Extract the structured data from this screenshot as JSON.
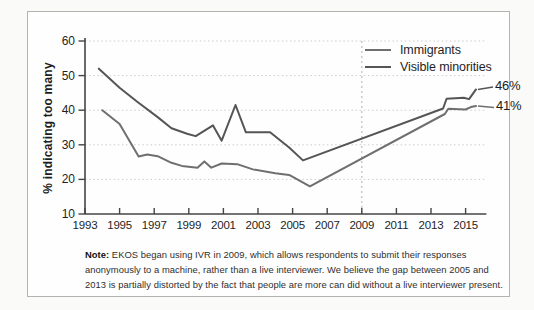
{
  "figure": {
    "y_axis_title": "% indicating too many",
    "note_label": "Note:",
    "note_text": " EKOS began using IVR in 2009, which allows respondents to submit their responses anonymously to a machine, rather than a live interviewer. We believe the gap between 2005 and 2013 is partially distorted by the fact that people are more can did without a live interviewer present."
  },
  "chart_data": {
    "type": "line",
    "title": "",
    "xlabel": "",
    "ylabel": "% indicating too many",
    "legend_position": "top-right",
    "grid": "horizontal-dashed",
    "divider_year": 2009,
    "x_axis": {
      "min": 1993,
      "max": 2016.2,
      "ticks": [
        1993,
        1995,
        1997,
        1999,
        2001,
        2003,
        2005,
        2007,
        2009,
        2011,
        2013,
        2015
      ]
    },
    "y_axis": {
      "min": 10,
      "max": 60,
      "ticks": [
        60,
        50,
        40,
        30,
        20,
        10
      ],
      "gridlines": [
        60,
        50,
        40,
        30,
        20
      ]
    },
    "series": [
      {
        "name": "Immigrants",
        "color": "#6f6f6f",
        "end_label": "41%",
        "points": [
          [
            1994,
            40
          ],
          [
            1995,
            36
          ],
          [
            1996.1,
            26.6
          ],
          [
            1996.6,
            27.2
          ],
          [
            1997.2,
            26.7
          ],
          [
            1998,
            24.8
          ],
          [
            1998.6,
            23.9
          ],
          [
            1999.5,
            23.4
          ],
          [
            1999.9,
            25.2
          ],
          [
            2000.3,
            23.4
          ],
          [
            2000.9,
            24.6
          ],
          [
            2001.8,
            24.4
          ],
          [
            2002.7,
            22.9
          ],
          [
            2004,
            21.8
          ],
          [
            2004.8,
            21.3
          ],
          [
            2006,
            18
          ],
          [
            2013.8,
            38.9
          ],
          [
            2014,
            40.4
          ],
          [
            2015,
            40.2
          ],
          [
            2015.3,
            40.9
          ],
          [
            2015.6,
            41.2
          ]
        ]
      },
      {
        "name": "Visible minorities",
        "color": "#555555",
        "end_label": "46%",
        "points": [
          [
            1993.8,
            52
          ],
          [
            1995,
            46.5
          ],
          [
            1996,
            42.5
          ],
          [
            1997.2,
            38
          ],
          [
            1998,
            34.8
          ],
          [
            1998.9,
            33.2
          ],
          [
            1999.4,
            32.5
          ],
          [
            2000.4,
            35.6
          ],
          [
            2000.9,
            31.2
          ],
          [
            2001.7,
            41.5
          ],
          [
            2002.3,
            33.6
          ],
          [
            2003.7,
            33.6
          ],
          [
            2004.8,
            29.2
          ],
          [
            2005.6,
            25.5
          ],
          [
            2013.7,
            40.5
          ],
          [
            2013.9,
            43.3
          ],
          [
            2014.9,
            43.6
          ],
          [
            2015.2,
            43.2
          ],
          [
            2015.6,
            46
          ]
        ]
      }
    ]
  }
}
